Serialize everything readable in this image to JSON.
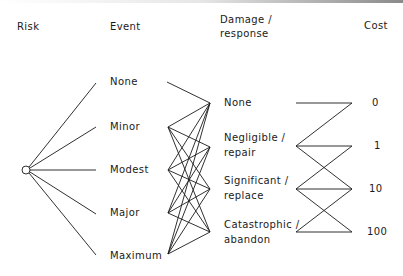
{
  "headers": {
    "risk": "Risk",
    "event": "Event",
    "damage_line1": "Damage /",
    "damage_line2": "response",
    "cost": "Cost"
  },
  "events": [
    {
      "label": "None"
    },
    {
      "label": "Minor"
    },
    {
      "label": "Modest"
    },
    {
      "label": "Major"
    },
    {
      "label": "Maximum"
    }
  ],
  "damages": [
    {
      "line1": "None",
      "line2": ""
    },
    {
      "line1": "Negligible /",
      "line2": "repair"
    },
    {
      "line1": "Significant /",
      "line2": "replace"
    },
    {
      "line1": "Catastrophic /",
      "line2": "abandon"
    }
  ],
  "costs": [
    {
      "value": "0"
    },
    {
      "value": "1"
    },
    {
      "value": "10"
    },
    {
      "value": "100"
    }
  ],
  "colors": {
    "line": "#1a1a1a",
    "background": "#ffffff"
  }
}
